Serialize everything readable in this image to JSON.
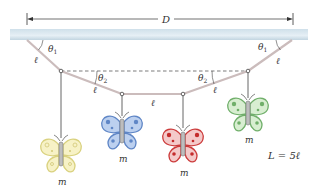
{
  "diagram": {
    "type": "physics-mobile-string",
    "dimension_label": "D",
    "angle_labels": {
      "upper_left": "θ",
      "upper_left_sub": "1",
      "upper_right": "θ",
      "upper_right_sub": "1",
      "lower_left": "θ",
      "lower_left_sub": "2",
      "lower_right": "θ",
      "lower_right_sub": "2"
    },
    "segment_labels": [
      "ℓ",
      "ℓ",
      "ℓ",
      "ℓ",
      "ℓ"
    ],
    "mass_labels": [
      "m",
      "m",
      "m",
      "m"
    ],
    "constraint_label": "L = 5ℓ",
    "butterflies": [
      {
        "name": "yellow",
        "wing": "#f6f0bf",
        "edge": "#d8cf7a",
        "dot": "#cfc36a"
      },
      {
        "name": "blue",
        "wing": "#b9cdee",
        "edge": "#5d84c4",
        "dot": "#5d84c4"
      },
      {
        "name": "red",
        "wing": "#f3c6c6",
        "edge": "#cc3a3a",
        "dot": "#c42a2a"
      },
      {
        "name": "green",
        "wing": "#d6edcf",
        "edge": "#6fae69",
        "dot": "#6fae69"
      }
    ],
    "colors": {
      "ceiling_top": "#c8dbe6",
      "ceiling_bottom": "#eef4f8",
      "string": "#c9b8b8",
      "hang_wire": "#555555",
      "dashed": "#444444"
    }
  }
}
